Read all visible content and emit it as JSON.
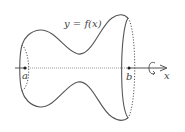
{
  "figure": {
    "curve_label": "y = f(x)",
    "point_a_label": "a",
    "point_b_label": "b",
    "axis_label": "x",
    "rotation_icon": "rotation-arrow-icon",
    "colors": {
      "stroke": "#555555",
      "axis": "#888888",
      "text": "#444444",
      "background": "#ffffff"
    }
  }
}
